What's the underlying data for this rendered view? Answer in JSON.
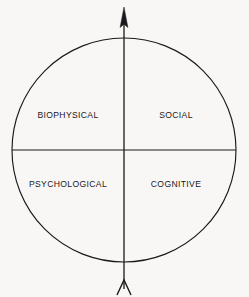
{
  "diagram": {
    "type": "quadrant-circle",
    "title": "",
    "background_color": "#f8f7f5",
    "stroke_color": "#1a1a1c",
    "text_color": "#18181a",
    "circle": {
      "center_x": 124,
      "center_y": 150,
      "radius": 112
    },
    "axes": {
      "vertical": {
        "x": 124,
        "top_y": 8,
        "bottom_y": 290,
        "arrowhead": "up",
        "tail": "fletching-v"
      },
      "horizontal": {
        "y": 150,
        "left_x": 12,
        "right_x": 236,
        "arrowhead": "none"
      }
    },
    "quadrants": [
      {
        "id": "top-left",
        "label": "BIOPHYSICAL",
        "center_x": 68,
        "center_y": 115
      },
      {
        "id": "top-right",
        "label": "SOCIAL",
        "center_x": 176,
        "center_y": 115
      },
      {
        "id": "bottom-left",
        "label": "PSYCHOLOGICAL",
        "center_x": 68,
        "center_y": 184
      },
      {
        "id": "bottom-right",
        "label": "COGNITIVE",
        "center_x": 176,
        "center_y": 184
      }
    ]
  }
}
